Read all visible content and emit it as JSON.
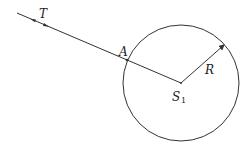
{
  "diagram": {
    "labels": {
      "trajectory": "T",
      "point_a": "A",
      "radius": "R",
      "center_main": "S",
      "center_sub": "1"
    },
    "colors": {
      "stroke": "#333333",
      "background": "#ffffff"
    },
    "geometry": {
      "circle_center": [
        181,
        83
      ],
      "circle_radius": 58,
      "line_start": [
        17,
        13
      ],
      "point_a": [
        127,
        60
      ],
      "radius_arrow_tip": [
        224,
        45
      ]
    }
  }
}
